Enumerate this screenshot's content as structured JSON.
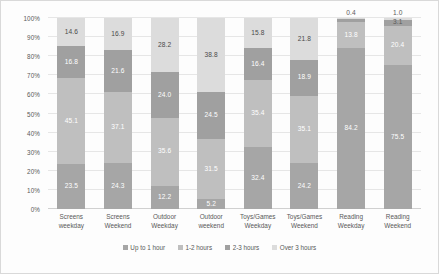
{
  "chart_data": {
    "type": "bar",
    "subtype": "stacked-percentage",
    "title": "",
    "xlabel": "",
    "ylabel": "",
    "ylim": [
      0,
      100
    ],
    "grid": true,
    "legend_position": "bottom",
    "categories": [
      "Screens weekday",
      "Screens Weekend",
      "Outdoor Weekday",
      "Outdoor weekend",
      "Toys/Games Weekday",
      "Toys/Games Weekend",
      "Reading Weekday",
      "Reading Weekend"
    ],
    "category_lines": [
      [
        "Screens",
        "weekday"
      ],
      [
        "Screens",
        "Weekend"
      ],
      [
        "Outdoor",
        "Weekday"
      ],
      [
        "Outdoor",
        "weekend"
      ],
      [
        "Toys/Games",
        "Weekday"
      ],
      [
        "Toys/Games",
        "Weekend"
      ],
      [
        "Reading",
        "Weekday"
      ],
      [
        "Reading",
        "Weekend"
      ]
    ],
    "series": [
      {
        "name": "Up to 1 hour",
        "color": "#a6a6a6",
        "values": [
          23.5,
          24.3,
          12.2,
          5.2,
          32.4,
          24.2,
          84.2,
          75.5
        ]
      },
      {
        "name": "1-2 hours",
        "color": "#bfbfbf",
        "values": [
          45.1,
          37.1,
          35.6,
          31.5,
          35.4,
          35.1,
          13.8,
          20.4
        ]
      },
      {
        "name": "2-3 hours",
        "color": "#a0a0a0",
        "values": [
          16.8,
          21.6,
          24.0,
          24.5,
          16.4,
          18.9,
          1.6,
          3.1
        ]
      },
      {
        "name": "Over 3 hours",
        "color": "#dcdcdc",
        "values": [
          14.6,
          16.9,
          28.2,
          38.8,
          15.8,
          21.8,
          0.4,
          1.0
        ]
      }
    ],
    "value_labels": [
      [
        "23.5",
        "45.1",
        "16.8",
        "14.6"
      ],
      [
        "24.3",
        "37.1",
        "21.6",
        "16.9"
      ],
      [
        "12.2",
        "35.6",
        "24.0",
        "28.2"
      ],
      [
        "5.2",
        "31.5",
        "24.5",
        "38.8"
      ],
      [
        "32.4",
        "35.4",
        "16.4",
        "15.8"
      ],
      [
        "24.2",
        "35.1",
        "18.9",
        "21.8"
      ],
      [
        "84.2",
        "13.8",
        "",
        "0.4"
      ],
      [
        "75.5",
        "20.4",
        "3.1",
        "1.0"
      ]
    ],
    "y_ticks": [
      "0%",
      "10%",
      "20%",
      "30%",
      "40%",
      "50%",
      "60%",
      "70%",
      "80%",
      "90%",
      "100%"
    ],
    "legend": [
      {
        "label": "Up to 1 hour",
        "color": "#a6a6a6"
      },
      {
        "label": "1-2 hours",
        "color": "#bfbfbf"
      },
      {
        "label": "2-3 hours",
        "color": "#a0a0a0"
      },
      {
        "label": "Over 3 hours",
        "color": "#dcdcdc"
      }
    ]
  }
}
